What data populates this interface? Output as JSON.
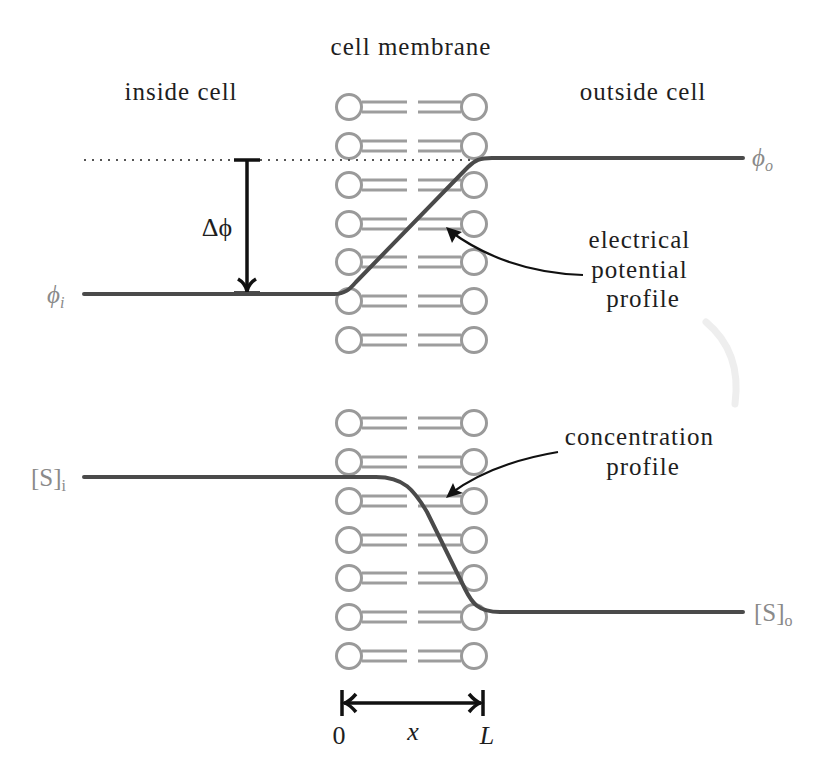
{
  "header": {
    "membrane_label": "cell membrane",
    "inside_label": "inside cell",
    "outside_label": "outside cell"
  },
  "potential": {
    "inside": {
      "symbol": "ϕ",
      "sub": "i"
    },
    "outside": {
      "symbol": "ϕ",
      "sub": "o"
    },
    "delta": "Δϕ",
    "annotation": [
      "electrical",
      "potential",
      "profile"
    ]
  },
  "concentration": {
    "inside": {
      "symbol": "[S]",
      "sub": "i"
    },
    "outside": {
      "symbol": "[S]",
      "sub": "o"
    },
    "annotation": [
      "concentration",
      "profile"
    ]
  },
  "axis": {
    "start": "0",
    "variable": "x",
    "end": "L"
  },
  "membrane": {
    "upper_rows": 7,
    "lower_rows": 7
  },
  "colors": {
    "profile_line": "#4a4a4a",
    "lipid": "#9a9a9a",
    "label_gray": "#8a8a8a",
    "text": "#1e1e1e"
  }
}
